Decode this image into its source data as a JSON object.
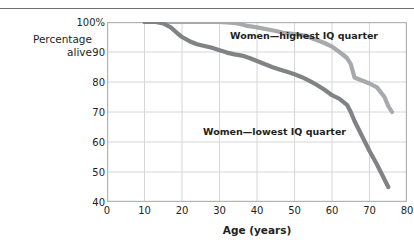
{
  "figure": {
    "y_axis_label_line1": "Percentage",
    "y_axis_label_line2": "alive",
    "x_axis_label": "Age (years)",
    "colors": {
      "highest_iq_line": "#a7a9ac",
      "lowest_iq_line": "#808285",
      "grid": "#d6d6d6",
      "axis": "#b3b3b3",
      "text": "#231f20",
      "top_rule": "#6f6f6f",
      "background": "#ffffff"
    }
  },
  "chart_data": {
    "type": "line",
    "title": "",
    "subtitle": "",
    "xlabel": "Age (years)",
    "ylabel": "Percentage alive",
    "xlim": [
      0,
      80
    ],
    "ylim": [
      40,
      100
    ],
    "xticks": [
      0,
      10,
      20,
      30,
      40,
      50,
      60,
      70,
      80
    ],
    "yticks": [
      40,
      50,
      60,
      70,
      80,
      90,
      100
    ],
    "ytick_labels": [
      "40",
      "50",
      "60",
      "70",
      "80",
      "90",
      "100%"
    ],
    "xtick_labels": [
      "0",
      "10",
      "20",
      "30",
      "40",
      "50",
      "60",
      "70",
      "80"
    ],
    "grid": true,
    "legend_position": "inline-annotations",
    "series": [
      {
        "name": "Women—highest IQ quarter",
        "color": "#a7a9ac",
        "label_x": 52,
        "label_y": 101,
        "x": [
          10,
          15,
          20,
          25,
          30,
          33,
          35,
          37,
          40,
          43,
          45,
          47,
          50,
          53,
          55,
          58,
          60,
          62,
          64,
          65,
          66,
          68,
          70,
          72,
          74,
          75,
          76
        ],
        "y": [
          100,
          100,
          100,
          100,
          100,
          99.8,
          99.5,
          98.8,
          98.2,
          97.5,
          97,
          96.4,
          96,
          95.4,
          94.4,
          93,
          91.8,
          90,
          88,
          86,
          81.5,
          80.5,
          79.5,
          78.2,
          75,
          72,
          70
        ]
      },
      {
        "name": "Women—lowest IQ quarter",
        "color": "#808285",
        "label_x": 40,
        "label_y": 67,
        "x": [
          10,
          13,
          15,
          17,
          19,
          20,
          22,
          24,
          26,
          28,
          30,
          32,
          34,
          36,
          38,
          40,
          42,
          44,
          46,
          48,
          50,
          52,
          54,
          56,
          58,
          60,
          62,
          64,
          65,
          66,
          68,
          70,
          72,
          74,
          75
        ],
        "y": [
          100,
          100,
          99.5,
          98.2,
          96,
          95,
          93.6,
          92.6,
          92,
          91.4,
          90.6,
          89.8,
          89.2,
          88.8,
          88,
          87,
          86,
          85,
          84.2,
          83.4,
          82.6,
          81.6,
          80.4,
          79,
          77.4,
          75.6,
          74.4,
          72.4,
          70,
          67,
          62,
          57,
          52.5,
          47.5,
          45
        ]
      }
    ],
    "annotations": [
      {
        "text": "Women—highest IQ quarter",
        "x": 52,
        "y": 101
      },
      {
        "text": "Women—lowest IQ quarter",
        "x": 40,
        "y": 67
      }
    ]
  }
}
